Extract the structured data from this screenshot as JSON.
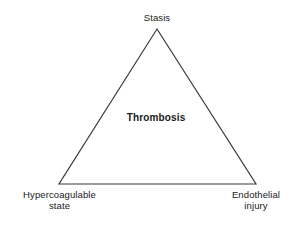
{
  "diagram": {
    "type": "triangle-concept-diagram",
    "center_label": "Thrombosis",
    "nodes": {
      "top": "Stasis",
      "bottom_left": "Hypercoagulable\nstate",
      "bottom_right": "Endothelial\ninjury"
    },
    "colors": {
      "background": "#ffffff",
      "stroke": "#3a3a3a",
      "text": "#1a1a1a"
    },
    "geometry": {
      "apex": "157,29",
      "bottom_left": "59,184",
      "bottom_right": "256,184",
      "stroke_width": "1.2"
    }
  }
}
